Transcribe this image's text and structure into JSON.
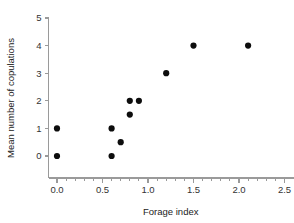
{
  "chart_data": {
    "type": "scatter",
    "title": "",
    "xlabel": "Forage index",
    "ylabel": "Mean number of copulations",
    "xlim": [
      -0.2,
      2.6
    ],
    "ylim": [
      -0.45,
      5.3
    ],
    "xticks": [
      0.0,
      0.5,
      1.0,
      1.5,
      2.0,
      2.5
    ],
    "xtick_labels": [
      "0.0",
      "0.5",
      "1.0",
      "1.5",
      "2.0",
      "2.5"
    ],
    "x_minor_ticks": [
      0.1,
      0.2,
      0.3,
      0.4,
      0.6,
      0.7,
      0.8,
      0.9,
      1.1,
      1.2,
      1.3,
      1.4,
      1.6,
      1.7,
      1.8,
      1.9,
      2.1,
      2.2,
      2.3,
      2.4
    ],
    "yticks": [
      0,
      1,
      2,
      3,
      4,
      5
    ],
    "ytick_labels": [
      "0",
      "1",
      "2",
      "3",
      "4",
      "5"
    ],
    "grid": false,
    "legend": false,
    "marker": "circle",
    "marker_color": "#0d0d0d",
    "marker_size": 3.1,
    "axis_color": "#9a9a9a",
    "points": [
      {
        "x": 0.0,
        "y": 1.0
      },
      {
        "x": 0.0,
        "y": 0.0
      },
      {
        "x": 0.6,
        "y": 1.0
      },
      {
        "x": 0.6,
        "y": 0.0
      },
      {
        "x": 0.7,
        "y": 0.5
      },
      {
        "x": 0.8,
        "y": 2.0
      },
      {
        "x": 0.8,
        "y": 1.5
      },
      {
        "x": 0.9,
        "y": 2.0
      },
      {
        "x": 1.2,
        "y": 3.0
      },
      {
        "x": 1.5,
        "y": 4.0
      },
      {
        "x": 2.1,
        "y": 4.0
      }
    ],
    "x": [
      0.0,
      0.0,
      0.6,
      0.6,
      0.7,
      0.8,
      0.8,
      0.9,
      1.2,
      1.5,
      2.1
    ],
    "values": [
      1.0,
      0.0,
      1.0,
      0.0,
      0.5,
      2.0,
      1.5,
      2.0,
      3.0,
      4.0,
      4.0
    ],
    "n_points": 11
  }
}
